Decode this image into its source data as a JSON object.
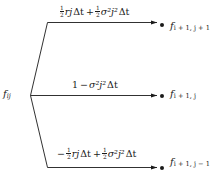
{
  "figure": {
    "type": "trinomial-tree-branch",
    "background_color": "#ffffff",
    "line_color": "#1a1a1a",
    "text_color": "#1a1a1a"
  },
  "source_node": {
    "symbol": "f",
    "subscript": "ij",
    "label": "f_ij"
  },
  "branches": [
    {
      "id": "up",
      "direction": "up",
      "coefficient_label": "1/2 rj Δt + 1/2 σ²j² Δt",
      "terms": [
        {
          "fraction_num": "1",
          "fraction_den": "2",
          "body": "rj",
          "delta": "Δt",
          "sign": ""
        },
        {
          "fraction_num": "1",
          "fraction_den": "2",
          "body": "σ²j²",
          "delta": "Δt",
          "sign": "+"
        }
      ],
      "target_symbol": "f",
      "target_subscript": "i + 1, j + 1",
      "target_label": "f_i+1,j+1"
    },
    {
      "id": "mid",
      "direction": "flat",
      "coefficient_label": "1 − σ²j² Δt",
      "terms": [
        {
          "plain": "1"
        },
        {
          "sign": "−",
          "body": "σ²j²",
          "delta": "Δt"
        }
      ],
      "target_symbol": "f",
      "target_subscript": "i + 1, j",
      "target_label": "f_i+1,j"
    },
    {
      "id": "down",
      "direction": "down",
      "coefficient_label": "− 1/2 rj Δt + 1/2 σ²j² Δt",
      "terms": [
        {
          "sign": "−",
          "fraction_num": "1",
          "fraction_den": "2",
          "body": "rj",
          "delta": "Δt"
        },
        {
          "sign": "+",
          "fraction_num": "1",
          "fraction_den": "2",
          "body": "σ²j²",
          "delta": "Δt"
        }
      ],
      "target_symbol": "f",
      "target_subscript": "i + 1, j − 1",
      "target_label": "f_i+1,j-1"
    }
  ],
  "symbols": {
    "f": "f",
    "r": "r",
    "j": "j",
    "sigma": "σ",
    "delta_t": "Δt",
    "one": "1",
    "two": "2",
    "plus": "+",
    "minus": "−",
    "sub_ij": "ij",
    "sub_up": "i + 1, j + 1",
    "sub_mid": "i + 1, j",
    "sub_down": "i + 1, j − 1",
    "sup_two": "2"
  }
}
